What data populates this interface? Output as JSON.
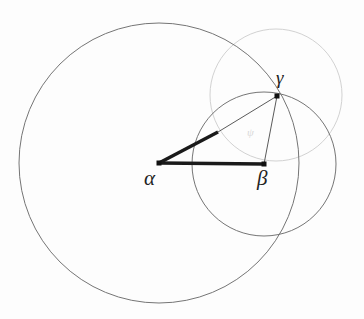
{
  "figure": {
    "background_color": "#fdfdfd",
    "width": 364,
    "height": 319,
    "labels": {
      "alpha": "α",
      "beta": "β",
      "gamma": "γ",
      "angle_mark": "ψ"
    },
    "stroke_colors": {
      "circle_dark": "#6e6e6e",
      "circle_light": "#cfcfcf",
      "segment_thick": "#1a1a1a",
      "segment_thin": "#555555",
      "vertex_dot": "#111111"
    }
  },
  "chart_data": {
    "type": "diagram",
    "xlabel": "",
    "ylabel": "",
    "points": [
      {
        "name": "alpha",
        "label": "α",
        "x": 159,
        "y": 163,
        "marker": "square-dot"
      },
      {
        "name": "beta",
        "label": "β",
        "x": 264,
        "y": 164,
        "marker": "square-dot"
      },
      {
        "name": "gamma",
        "label": "γ",
        "x": 277,
        "y": 96,
        "marker": "square-dot"
      },
      {
        "name": "midpoint-alpha-gamma",
        "label": "",
        "x": 218,
        "y": 132,
        "marker": "none"
      }
    ],
    "circles": [
      {
        "name": "circle-alpha",
        "center": [
          159,
          163
        ],
        "radius": 140,
        "stroke": "#6e6e6e",
        "stroke_width": 1.0,
        "fill": "none"
      },
      {
        "name": "circle-beta",
        "center": [
          264,
          164
        ],
        "radius": 72,
        "stroke": "#6e6e6e",
        "stroke_width": 1.0,
        "fill": "none"
      },
      {
        "name": "circle-gamma",
        "center": [
          276,
          95
        ],
        "radius": 66,
        "stroke": "#cfcfcf",
        "stroke_width": 1.0,
        "fill": "none"
      }
    ],
    "segments": [
      {
        "name": "segment-alpha-beta",
        "from": [
          159,
          163
        ],
        "to": [
          264,
          164
        ],
        "stroke": "#1a1a1a",
        "stroke_width": 3.4,
        "style": "thick"
      },
      {
        "name": "segment-alpha-mid",
        "from": [
          159,
          163
        ],
        "to": [
          218,
          132
        ],
        "stroke": "#1a1a1a",
        "stroke_width": 3.4,
        "style": "thick"
      },
      {
        "name": "segment-mid-gamma",
        "from": [
          218,
          132
        ],
        "to": [
          277,
          96
        ],
        "stroke": "#555555",
        "stroke_width": 1.0,
        "style": "thin"
      },
      {
        "name": "segment-gamma-beta",
        "from": [
          277,
          96
        ],
        "to": [
          264,
          164
        ],
        "stroke": "#555555",
        "stroke_width": 1.0,
        "style": "thin"
      }
    ],
    "grid": false,
    "legend": "none"
  }
}
